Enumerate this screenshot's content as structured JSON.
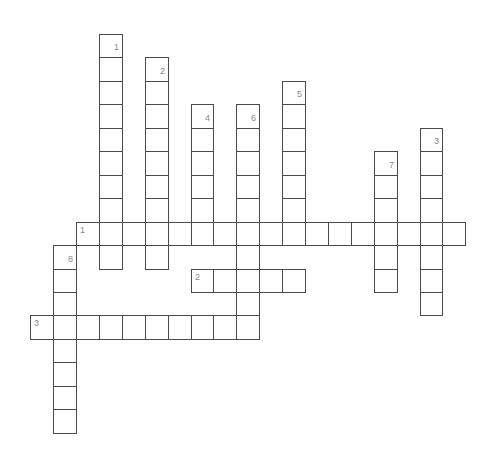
{
  "puzzle": {
    "title": "",
    "grid": {
      "origin_x": 76,
      "origin_y": 34,
      "cell_w": 22.9,
      "cell_h": 23.45,
      "line_color": "#4a4a4a",
      "number_color": "#8a8a8a"
    },
    "across": [
      {
        "number": "1",
        "row": 8,
        "col": 0,
        "length": 17
      },
      {
        "number": "2",
        "row": 10,
        "col": 5,
        "length": 5
      },
      {
        "number": "3",
        "row": 12,
        "col": -2,
        "length": 10
      }
    ],
    "down": [
      {
        "number": "1",
        "row": 0,
        "col": 1,
        "length": 10
      },
      {
        "number": "2",
        "row": 1,
        "col": 3,
        "length": 9
      },
      {
        "number": "4",
        "row": 3,
        "col": 5,
        "length": 6
      },
      {
        "number": "6",
        "row": 3,
        "col": 7,
        "length": 10
      },
      {
        "number": "5",
        "row": 2,
        "col": 9,
        "length": 7
      },
      {
        "number": "7",
        "row": 5,
        "col": 13,
        "length": 6
      },
      {
        "number": "3",
        "row": 4,
        "col": 15,
        "length": 8
      },
      {
        "number": "8",
        "row": 9,
        "col": -1,
        "length": 8
      }
    ]
  }
}
